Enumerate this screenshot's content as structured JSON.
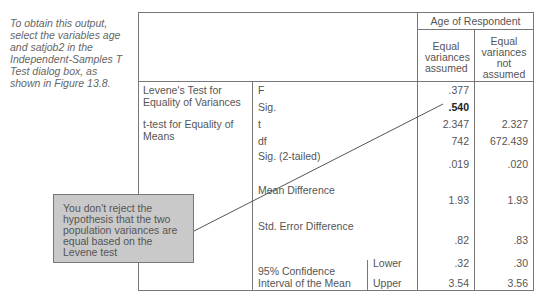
{
  "side_note": "To obtain this output, select the variables age and satjob2 in the Independent-Samples T Test dialog box, as shown in Figure 13.8.",
  "table": {
    "group_header": "Age of Respondent",
    "columns": [
      "Equal variances assumed",
      "Equal variances not assumed"
    ],
    "sections": [
      {
        "label": "Levene's Test for Equality of Variances"
      },
      {
        "label": "t-test for Equality of Means"
      }
    ],
    "rows": [
      {
        "stat": "F",
        "assumed": ".377",
        "not_assumed": ""
      },
      {
        "stat": "Sig.",
        "assumed": ".540",
        "not_assumed": ""
      },
      {
        "stat": "t",
        "assumed": "2.347",
        "not_assumed": "2.327"
      },
      {
        "stat": "df",
        "assumed": "742",
        "not_assumed": "672.439"
      },
      {
        "stat": "Sig. (2-tailed)",
        "assumed": ".019",
        "not_assumed": ".020"
      },
      {
        "stat": "Mean Difference",
        "assumed": "1.93",
        "not_assumed": "1.93"
      },
      {
        "stat": "Std. Error Difference",
        "assumed": ".82",
        "not_assumed": ".83"
      },
      {
        "stat": "95% Confidence Interval of the Mean",
        "sub": "Lower",
        "assumed": ".32",
        "not_assumed": ".30"
      },
      {
        "stat": "",
        "sub": "Upper",
        "assumed": "3.54",
        "not_assumed": "3.56"
      }
    ]
  },
  "callout": {
    "text": "You don't reject the hypothesis that the two population variances are equal based on the Levene test"
  }
}
